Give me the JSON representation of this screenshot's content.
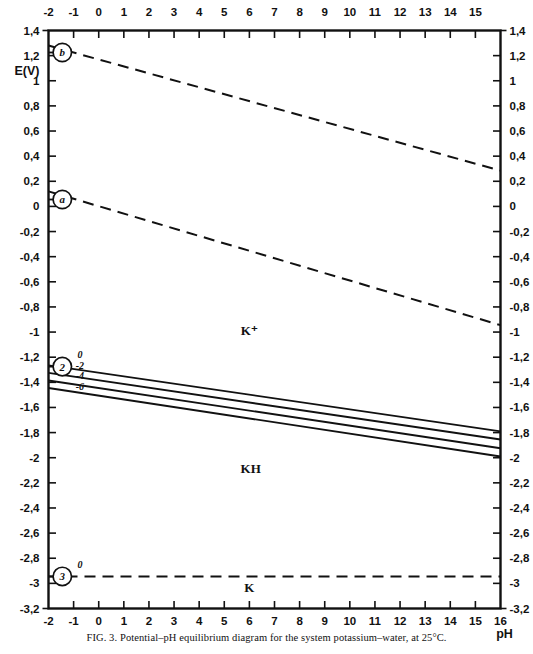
{
  "figure": {
    "caption_prefix": "FIG. 3.",
    "caption_text": "Potential–pH equilibrium diagram for the system potassium–water, at 25°C.",
    "y_axis_title": "E(V)",
    "x_axis_title": "pH"
  },
  "chart_data": {
    "type": "line",
    "title": "Potential–pH equilibrium diagram for the system potassium–water, at 25°C",
    "xlabel": "pH",
    "ylabel": "E(V)",
    "xlim": [
      -2,
      16
    ],
    "ylim": [
      -3.2,
      1.4
    ],
    "grid": false,
    "legend": "none",
    "x_ticks": [
      -2,
      -1,
      0,
      1,
      2,
      3,
      4,
      5,
      6,
      7,
      8,
      9,
      10,
      11,
      12,
      13,
      14,
      15,
      16
    ],
    "x_tick_labels": [
      "-2",
      "-1",
      "0",
      "1",
      "2",
      "3",
      "4",
      "5",
      "6",
      "7",
      "8",
      "9",
      "10",
      "11",
      "12",
      "13",
      "14",
      "15",
      "16"
    ],
    "y_ticks": [
      1.4,
      1.2,
      1.0,
      0.8,
      0.6,
      0.4,
      0.2,
      0.0,
      -0.2,
      -0.4,
      -0.6,
      -0.8,
      -1.0,
      -1.2,
      -1.4,
      -1.6,
      -1.8,
      -2.0,
      -2.2,
      -2.4,
      -2.6,
      -2.8,
      -3.0,
      -3.2
    ],
    "y_tick_labels": [
      "1,4",
      "1,2",
      "1",
      "0,8",
      "0,6",
      "0,4",
      "0,2",
      "0",
      "-0,2",
      "-0,4",
      "-0,6",
      "-0,8",
      "-1",
      "-1,2",
      "-1,4",
      "-1,6",
      "-1,8",
      "-2",
      "-2,2",
      "-2,4",
      "-2,6",
      "-2,8",
      "-3",
      "-3,2"
    ],
    "series": [
      {
        "name": "b",
        "label": "b",
        "style": "dashed",
        "x": [
          -2,
          16
        ],
        "y": [
          1.28,
          0.285
        ],
        "marker_label": "b",
        "marker_x": -2,
        "marker_y": 1.22
      },
      {
        "name": "a",
        "label": "a",
        "style": "dashed",
        "x": [
          -2,
          16
        ],
        "y": [
          0.12,
          -0.945
        ],
        "marker_label": "a",
        "marker_x": -2,
        "marker_y": 0.06
      },
      {
        "name": "2-0",
        "label": "0",
        "style": "solid",
        "x": [
          -2,
          16
        ],
        "y": [
          -1.265,
          -1.79
        ]
      },
      {
        "name": "2-minus2",
        "label": "-2",
        "style": "solid",
        "x": [
          -2,
          16
        ],
        "y": [
          -1.325,
          -1.855
        ]
      },
      {
        "name": "2-minus4",
        "label": "-4",
        "style": "solid",
        "x": [
          -2,
          16
        ],
        "y": [
          -1.385,
          -1.925
        ]
      },
      {
        "name": "2-minus6",
        "label": "-6",
        "style": "solid",
        "x": [
          -2,
          16
        ],
        "y": [
          -1.445,
          -1.99
        ]
      },
      {
        "name": "3-0",
        "label": "0",
        "style": "dashed",
        "x": [
          -2,
          16
        ],
        "y": [
          -2.945,
          -2.945
        ],
        "marker_label": "3",
        "marker_x": -2,
        "marker_y": -2.945
      }
    ],
    "reaction_markers": [
      {
        "id": "b",
        "text": "b",
        "x": -1.45,
        "y": 1.225
      },
      {
        "id": "a",
        "text": "a",
        "x": -1.45,
        "y": 0.055
      },
      {
        "id": "2",
        "text": "2",
        "x": -1.45,
        "y": -1.275
      },
      {
        "id": "3",
        "text": "3",
        "x": -1.45,
        "y": -2.945
      }
    ],
    "line_value_labels": [
      {
        "text": "0",
        "x": -0.75,
        "y": -1.205
      },
      {
        "text": "-2",
        "x": -0.75,
        "y": -1.29
      },
      {
        "text": "-4",
        "x": -0.75,
        "y": -1.375
      },
      {
        "text": "-6",
        "x": -0.75,
        "y": -1.46
      }
    ],
    "annotations": [
      {
        "text": "K⁺",
        "x": 6.0,
        "y": -1.02,
        "role": "domain-label"
      },
      {
        "text": "KH",
        "x": 6.05,
        "y": -2.12,
        "role": "domain-label"
      },
      {
        "text": "K",
        "x": 6.0,
        "y": -3.07,
        "role": "domain-label"
      }
    ]
  }
}
